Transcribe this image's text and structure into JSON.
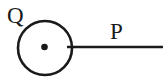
{
  "diagram": {
    "background_color": "#ffffff",
    "stroke_color": "#1a1a1a",
    "labels": {
      "q": "Q",
      "p": "P"
    },
    "circle": {
      "cx": "45",
      "cy": "48",
      "r": "27",
      "stroke_width": "2.6"
    },
    "center_dot": {
      "cx": "44.5",
      "cy": "47",
      "r": "3.3"
    },
    "line": {
      "x1": "67",
      "y1": "47",
      "x2": "163",
      "y2": "47",
      "stroke_width": "2.6"
    },
    "q_label_pos": {
      "x": "7",
      "y": "23"
    },
    "p_label_pos": {
      "x": "110",
      "y": "39"
    }
  }
}
